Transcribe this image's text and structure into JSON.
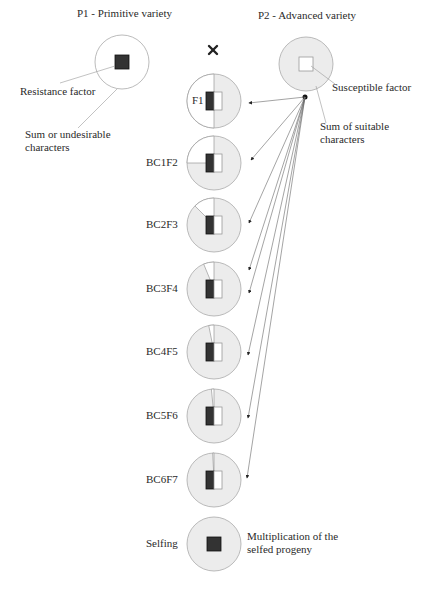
{
  "parents": {
    "p1": {
      "title": "P1 - Primitive variety",
      "annotation_factor": "Resistance factor",
      "annotation_sum_line1": "Sum or undesirable",
      "annotation_sum_line2": "characters"
    },
    "p2": {
      "title": "P2 - Advanced variety",
      "annotation_factor": "Susceptible factor",
      "annotation_sum_line1": "Sum of suitable",
      "annotation_sum_line2": "characters"
    },
    "cross_symbol": "×"
  },
  "generations": [
    {
      "label": "F1",
      "white_sector_deg": 180
    },
    {
      "label": "BC1F2",
      "white_sector_deg": 90
    },
    {
      "label": "BC2F3",
      "white_sector_deg": 45
    },
    {
      "label": "BC3F4",
      "white_sector_deg": 22.5
    },
    {
      "label": "BC4F5",
      "white_sector_deg": 11.25
    },
    {
      "label": "BC5F6",
      "white_sector_deg": 5.6
    },
    {
      "label": "BC6F7",
      "white_sector_deg": 2.8
    }
  ],
  "selfing": {
    "label": "Selfing",
    "annotation_line1": "Multiplication of the",
    "annotation_line2": "selfed progeny"
  },
  "colors": {
    "fill_grey": "#ececec",
    "stroke": "#9a9a9a",
    "dark_square": "#333333",
    "arrow": "#555555"
  }
}
